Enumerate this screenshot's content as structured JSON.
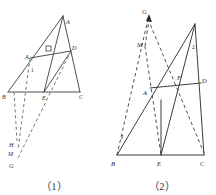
{
  "document": {
    "kind": "geometry-figure-pair",
    "background_color": "#ffffff",
    "ink_color": "#2b2b2b"
  },
  "figures": [
    {
      "id": "figure-1",
      "caption": "（1）",
      "style": {
        "solid_stroke": "#3d3d3d",
        "dashed_stroke": "#6b6b6b"
      },
      "points": {
        "A_apex": {
          "label": "A",
          "x": 63,
          "y": 16
        },
        "A_left": {
          "label": "A",
          "x": 30,
          "y": 57
        },
        "D": {
          "label": "D",
          "x": 71,
          "y": 49
        },
        "B": {
          "label": "B",
          "x": 8,
          "y": 94
        },
        "E": {
          "label": "E",
          "x": 44,
          "y": 94
        },
        "C": {
          "label": "C",
          "x": 80,
          "y": 94
        },
        "H": {
          "label": "H",
          "x": 13,
          "y": 143
        },
        "M": {
          "label": "M",
          "x": 14,
          "y": 152
        },
        "G": {
          "label": "G",
          "x": 13,
          "y": 163
        }
      },
      "labels": [
        {
          "name": "vertex-label-A-apex",
          "text": "A",
          "x": 66,
          "y": 22
        },
        {
          "name": "vertex-label-A-left",
          "text": "A",
          "x": 27,
          "y": 60
        },
        {
          "name": "vertex-label-D",
          "text": "D",
          "x": 72,
          "y": 49
        },
        {
          "name": "vertex-label-B",
          "text": "B",
          "x": 3,
          "y": 99
        },
        {
          "name": "vertex-label-E",
          "text": "E",
          "x": 43,
          "y": 100
        },
        {
          "name": "vertex-label-C",
          "text": "C",
          "x": 79,
          "y": 99
        },
        {
          "name": "vertex-label-H",
          "text": "H",
          "x": 10,
          "y": 146
        },
        {
          "name": "vertex-label-M",
          "text": "M",
          "x": 10,
          "y": 155
        },
        {
          "name": "vertex-label-G",
          "text": "G",
          "x": 10,
          "y": 167
        },
        {
          "name": "angle-label-1",
          "text": "1",
          "x": 32,
          "y": 71
        }
      ],
      "solid_segments": [
        {
          "name": "side-B-to-apex",
          "x1": 8,
          "y1": 92,
          "x2": 63,
          "y2": 16
        },
        {
          "name": "side-apex-to-C",
          "x1": 63,
          "y1": 16,
          "x2": 80,
          "y2": 92
        },
        {
          "name": "base-B-to-C",
          "x1": 8,
          "y1": 92,
          "x2": 80,
          "y2": 92
        },
        {
          "name": "segment-A-to-D",
          "x1": 30,
          "y1": 58,
          "x2": 71,
          "y2": 51
        },
        {
          "name": "segment-apex-to-E",
          "x1": 63,
          "y1": 16,
          "x2": 44,
          "y2": 92
        },
        {
          "name": "cevian-D-to-E",
          "x1": 71,
          "y1": 51,
          "x2": 44,
          "y2": 92
        }
      ],
      "dashed_segments": [
        {
          "name": "dashed-D-to-G",
          "x1": 71,
          "y1": 51,
          "x2": 17,
          "y2": 160
        },
        {
          "name": "dashed-A-to-M",
          "x1": 30,
          "y1": 58,
          "x2": 18,
          "y2": 150
        },
        {
          "name": "dashed-B-to-H",
          "x1": 14,
          "y1": 92,
          "x2": 17,
          "y2": 141
        }
      ],
      "right_angle_marks": [
        {
          "name": "right-angle-mark-at-F",
          "x": 48,
          "y": 49,
          "size": 5
        }
      ]
    },
    {
      "id": "figure-2",
      "caption": "（2）",
      "style": {
        "solid_stroke": "#3d3d3d",
        "dashed_stroke": "#3d3d3d"
      },
      "points": {
        "G": {
          "label": "G",
          "x": 40,
          "y": 12
        },
        "M": {
          "label": "M",
          "x": 36,
          "y": 42
        },
        "A": {
          "label": "A",
          "x": 42,
          "y": 90
        },
        "F": {
          "label": "F",
          "x": 71,
          "y": 82
        },
        "D": {
          "label": "D",
          "x": 93,
          "y": 82
        },
        "I": {
          "label": "I",
          "x": 17,
          "y": 137
        },
        "B": {
          "label": "B",
          "x": 9,
          "y": 158
        },
        "E": {
          "label": "E",
          "x": 53,
          "y": 158
        },
        "C": {
          "label": "C",
          "x": 95,
          "y": 158
        }
      },
      "labels": [
        {
          "name": "vertex-label-G",
          "text": "G",
          "x": 36,
          "y": 15
        },
        {
          "name": "vertex-label-M",
          "text": "M",
          "x": 31,
          "y": 45
        },
        {
          "name": "vertex-label-A",
          "text": "A",
          "x": 36,
          "y": 95
        },
        {
          "name": "vertex-label-F",
          "text": "F",
          "x": 70,
          "y": 80
        },
        {
          "name": "vertex-label-D",
          "text": "D",
          "x": 93,
          "y": 82
        },
        {
          "name": "vertex-label-I",
          "text": "I",
          "x": 14,
          "y": 138
        },
        {
          "name": "vertex-label-B",
          "text": "B",
          "x": 4,
          "y": 165
        },
        {
          "name": "vertex-label-E",
          "text": "E",
          "x": 50,
          "y": 165
        },
        {
          "name": "vertex-label-C",
          "text": "C",
          "x": 93,
          "y": 165
        },
        {
          "name": "angle-label-2",
          "text": "2",
          "x": 85,
          "y": 47
        }
      ],
      "solid_segments": [
        {
          "name": "base-B-to-C",
          "x1": 9,
          "y1": 155,
          "x2": 96,
          "y2": 155
        },
        {
          "name": "side-apex-to-C",
          "x1": 87,
          "y1": 24,
          "x2": 96,
          "y2": 155
        },
        {
          "name": "side-B-to-apex",
          "x1": 9,
          "y1": 155,
          "x2": 87,
          "y2": 24
        },
        {
          "name": "segment-A-to-D",
          "x1": 42,
          "y1": 88,
          "x2": 93,
          "y2": 83
        },
        {
          "name": "cevian-apex-to-E",
          "x1": 87,
          "y1": 24,
          "x2": 53,
          "y2": 155
        },
        {
          "name": "median-E-upper",
          "x1": 53,
          "y1": 155,
          "x2": 53,
          "y2": 100
        }
      ],
      "dashed_segments": [
        {
          "name": "dashed-B-to-G",
          "x1": 9,
          "y1": 155,
          "x2": 40,
          "y2": 17
        },
        {
          "name": "dashed-G-to-C",
          "x1": 40,
          "y1": 17,
          "x2": 96,
          "y2": 153
        },
        {
          "name": "dashed-M-to-E",
          "x1": 37,
          "y1": 45,
          "x2": 53,
          "y2": 155
        },
        {
          "name": "dashed-M-to-G",
          "x1": 37,
          "y1": 45,
          "x2": 41,
          "y2": 18
        }
      ],
      "arrow_marks": [
        {
          "name": "arrowhead-at-G",
          "x": 41,
          "y": 17
        }
      ]
    }
  ]
}
